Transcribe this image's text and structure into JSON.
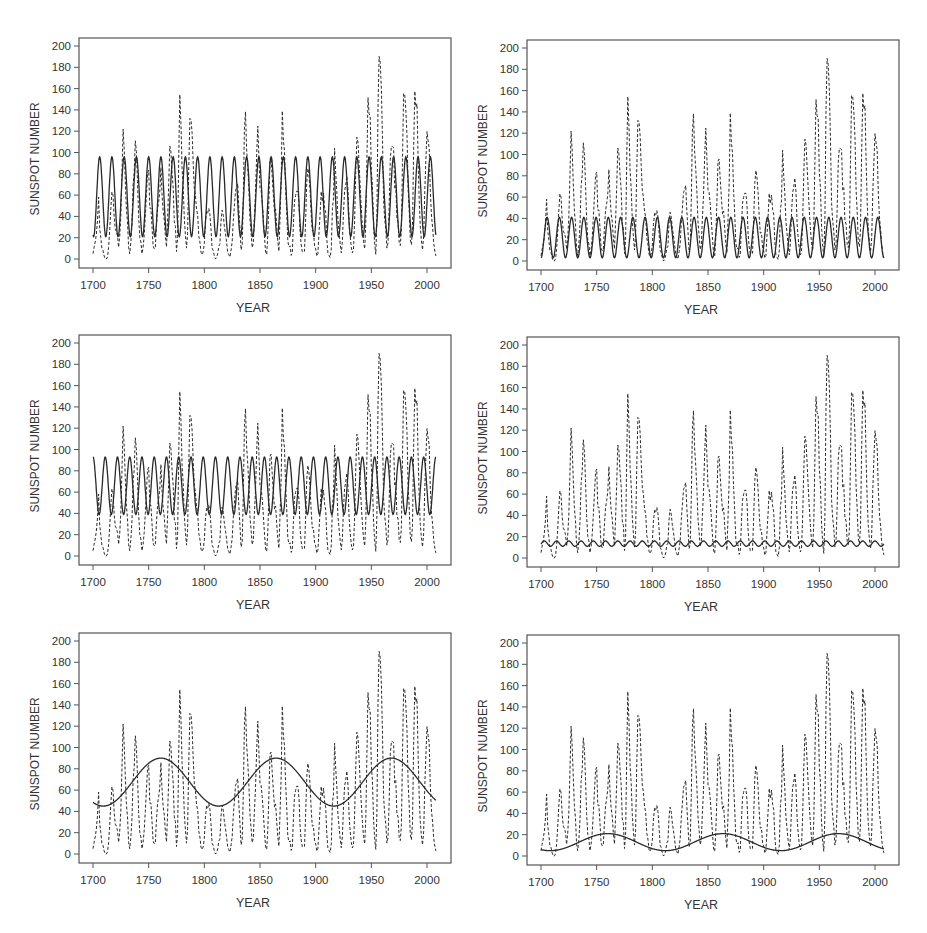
{
  "figure": {
    "panel_count": 6,
    "layout": "3 rows x 2 columns"
  },
  "chart_data": [
    {
      "id": "panel-1",
      "type": "line",
      "position": "row1-left",
      "xlabel": "YEAR",
      "ylabel": "SUNSPOT NUMBER",
      "xlim": [
        1700,
        2008
      ],
      "ylim": [
        0,
        200
      ],
      "xticks": [
        1700,
        1750,
        1800,
        1850,
        1900,
        1950,
        2000
      ],
      "yticks": [
        0,
        20,
        40,
        60,
        80,
        100,
        120,
        140,
        160,
        180,
        200
      ],
      "series": [
        {
          "name": "Observed annual sunspot number",
          "style": "dashed",
          "ref": "observed"
        },
        {
          "name": "Fitted sinusoid (~11-yr cycle)",
          "style": "solid",
          "model": {
            "mean": 58.5,
            "amplitude": 37.5,
            "period": 11.0,
            "peak_year": 1706
          }
        }
      ]
    },
    {
      "id": "panel-2",
      "type": "line",
      "position": "row1-right",
      "xlabel": "YEAR",
      "ylabel": "SUNSPOT NUMBER",
      "xlim": [
        1700,
        2008
      ],
      "ylim": [
        0,
        200
      ],
      "xticks": [
        1700,
        1750,
        1800,
        1850,
        1900,
        1950,
        2000
      ],
      "yticks": [
        0,
        20,
        40,
        60,
        80,
        100,
        120,
        140,
        160,
        180,
        200
      ],
      "series": [
        {
          "name": "Observed annual sunspot number",
          "style": "dashed",
          "ref": "observed"
        },
        {
          "name": "Fitted sinusoid (~11-yr cycle)",
          "style": "solid",
          "model": {
            "mean": 22,
            "amplitude": 19,
            "period": 11.0,
            "peak_year": 1705.5
          }
        }
      ]
    },
    {
      "id": "panel-3",
      "type": "line",
      "position": "row2-left",
      "xlabel": "YEAR",
      "ylabel": "SUNSPOT NUMBER",
      "xlim": [
        1700,
        2008
      ],
      "ylim": [
        0,
        200
      ],
      "xticks": [
        1700,
        1750,
        1800,
        1850,
        1900,
        1950,
        2000
      ],
      "yticks": [
        0,
        20,
        40,
        60,
        80,
        100,
        120,
        140,
        160,
        180,
        200
      ],
      "series": [
        {
          "name": "Observed annual sunspot number",
          "style": "dashed",
          "ref": "observed"
        },
        {
          "name": "Fitted sinusoid (~11-yr cycle)",
          "style": "solid",
          "model": {
            "mean": 66,
            "amplitude": 27,
            "period": 11.0,
            "peak_year": 1700
          }
        }
      ]
    },
    {
      "id": "panel-4",
      "type": "line",
      "position": "row2-right",
      "xlabel": "YEAR",
      "ylabel": "SUNSPOT NUMBER",
      "xlim": [
        1700,
        2008
      ],
      "ylim": [
        0,
        200
      ],
      "xticks": [
        1700,
        1750,
        1800,
        1850,
        1900,
        1950,
        2000
      ],
      "yticks": [
        0,
        20,
        40,
        60,
        80,
        100,
        120,
        140,
        160,
        180,
        200
      ],
      "series": [
        {
          "name": "Observed annual sunspot number",
          "style": "dashed",
          "ref": "observed"
        },
        {
          "name": "Fitted sinusoid (~11-yr cycle, small amplitude)",
          "style": "solid",
          "model": {
            "mean": 13.5,
            "amplitude": 2.5,
            "period": 11.0,
            "peak_year": 1703
          }
        }
      ]
    },
    {
      "id": "panel-5",
      "type": "line",
      "position": "row3-left",
      "xlabel": "YEAR",
      "ylabel": "SUNSPOT NUMBER",
      "xlim": [
        1700,
        2008
      ],
      "ylim": [
        0,
        200
      ],
      "xticks": [
        1700,
        1750,
        1800,
        1850,
        1900,
        1950,
        2000
      ],
      "yticks": [
        0,
        20,
        40,
        60,
        80,
        100,
        120,
        140,
        160,
        180,
        200
      ],
      "series": [
        {
          "name": "Observed annual sunspot number",
          "style": "dashed",
          "ref": "observed"
        },
        {
          "name": "Fitted sinusoid (~104-yr cycle)",
          "style": "solid",
          "model": {
            "mean": 67.5,
            "amplitude": 22.5,
            "period": 103.5,
            "peak_year": 1761
          }
        }
      ]
    },
    {
      "id": "panel-6",
      "type": "line",
      "position": "row3-right",
      "xlabel": "YEAR",
      "ylabel": "SUNSPOT NUMBER",
      "xlim": [
        1700,
        2008
      ],
      "ylim": [
        0,
        200
      ],
      "xticks": [
        1700,
        1750,
        1800,
        1850,
        1900,
        1950,
        2000
      ],
      "yticks": [
        0,
        20,
        40,
        60,
        80,
        100,
        120,
        140,
        160,
        180,
        200
      ],
      "series": [
        {
          "name": "Observed annual sunspot number",
          "style": "dashed",
          "ref": "observed"
        },
        {
          "name": "Fitted sinusoid (~104-yr cycle, small amplitude)",
          "style": "solid",
          "model": {
            "mean": 13,
            "amplitude": 8,
            "period": 103.5,
            "peak_year": 1760
          }
        }
      ]
    }
  ],
  "observed": {
    "start_year": 1700,
    "values": [
      5,
      11,
      16,
      23,
      36,
      58,
      29,
      20,
      10,
      8,
      3,
      0,
      0,
      2,
      11,
      27,
      47,
      63,
      60,
      39,
      28,
      26,
      22,
      11,
      21,
      40,
      78,
      122,
      103,
      73,
      47,
      35,
      11,
      5,
      16,
      34,
      70,
      81,
      111,
      101,
      73,
      40,
      20,
      16,
      5,
      11,
      22,
      40,
      60,
      80.9,
      83.4,
      47.7,
      47.8,
      30.7,
      12.2,
      9.6,
      10.2,
      32.4,
      47.6,
      54,
      62.9,
      85.9,
      61.2,
      45.1,
      36.4,
      20.9,
      11.4,
      37.8,
      69.8,
      106.1,
      100.8,
      81.6,
      66.5,
      34.8,
      30.6,
      7,
      19.8,
      92.5,
      154.4,
      125.9,
      84.8,
      68.1,
      38.5,
      22.8,
      10.2,
      24.1,
      82.9,
      132,
      130.9,
      118.1,
      89.9,
      66.6,
      60,
      46.9,
      41,
      21.3,
      16,
      6.4,
      4.1,
      6.8,
      14.5,
      34,
      45,
      43.1,
      47.5,
      42.2,
      28.1,
      10.1,
      8.1,
      2.5,
      0,
      1.4,
      5,
      12.2,
      13.9,
      35.4,
      45.8,
      41,
      30.1,
      23.9,
      15.6,
      6.6,
      4,
      1.8,
      8.5,
      16.6,
      36.3,
      49.6,
      64.2,
      67,
      70.9,
      47.8,
      27.5,
      8.5,
      13.2,
      56.9,
      121.5,
      138.3,
      103.2,
      85.7,
      64.6,
      36.7,
      24.2,
      10.7,
      15,
      40.1,
      61.5,
      98.5,
      124.7,
      96.3,
      66.6,
      64.5,
      54.1,
      39,
      20.6,
      6.7,
      4.3,
      22.7,
      54.8,
      93.8,
      95.8,
      77.2,
      59.1,
      44,
      47,
      30.5,
      16.3,
      7.3,
      37.6,
      74,
      139,
      111.2,
      101.6,
      66.2,
      44.7,
      17,
      11.3,
      12.4,
      3.4,
      6,
      32.3,
      54.3,
      59.7,
      63.7,
      63.5,
      52.2,
      25.4,
      13.1,
      6.8,
      6.3,
      7.1,
      35.6,
      73,
      85.1,
      78,
      64,
      41.8,
      26.2,
      26.7,
      12.1,
      9.5,
      2.7,
      5,
      24.4,
      42,
      63.5,
      53.8,
      62,
      48.5,
      43.9,
      18.6,
      5.7,
      3.6,
      1.4,
      9.6,
      47.4,
      57.1,
      103.9,
      80.6,
      63.6,
      37.6,
      26.1,
      14.2,
      5.8,
      16.7,
      44.3,
      63.9,
      69,
      77.8,
      64.9,
      35.7,
      21.2,
      11.1,
      5.7,
      8.7,
      36.1,
      79.7,
      114.4,
      109.6,
      88.8,
      67.8,
      47.5,
      30.6,
      16.3,
      9.6,
      33.2,
      92.6,
      151.6,
      136.3,
      134.7,
      83.9,
      69.4,
      31.5,
      13.9,
      4.4,
      38,
      141.7,
      190.2,
      184.8,
      159,
      112.3,
      53.9,
      37.5,
      27.9,
      10.2,
      15.1,
      47,
      93.8,
      105.9,
      105.5,
      104.5,
      66.6,
      68.9,
      38,
      34.5,
      15.5,
      12.6,
      27.5,
      92.5,
      155.4,
      154.6,
      140.4,
      115.9,
      66.6,
      45.9,
      17.9,
      13.4,
      29.4,
      100.2,
      157.6,
      142.6,
      145.7,
      94.3,
      54.6,
      29.9,
      17.5,
      8.6,
      21.5,
      64.3,
      93.3,
      119.6,
      111,
      104,
      63.7,
      40.4,
      29.8,
      15.2,
      7.5,
      2.9
    ]
  },
  "labels": {
    "xlabel": "YEAR",
    "ylabel": "SUNSPOT NUMBER"
  },
  "colors": {
    "line": "#2a2a2a",
    "axis": "#555555",
    "text": "#333333",
    "background": "#ffffff"
  }
}
